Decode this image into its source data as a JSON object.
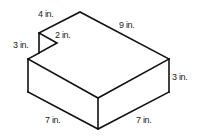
{
  "diagram": {
    "type": "3D rectangular prism with triangular notch",
    "colors": {
      "stroke": "#111111",
      "text": "#222222",
      "background": "#ffffff"
    },
    "labels": {
      "top_left_edge": "4 in.",
      "top_right_edge": "9 in.",
      "notch_vertical": "3 in.",
      "notch_diagonal": "2 in.",
      "right_height": "3 in.",
      "front_left_edge": "7 in.",
      "front_right_edge": "7 in."
    }
  }
}
